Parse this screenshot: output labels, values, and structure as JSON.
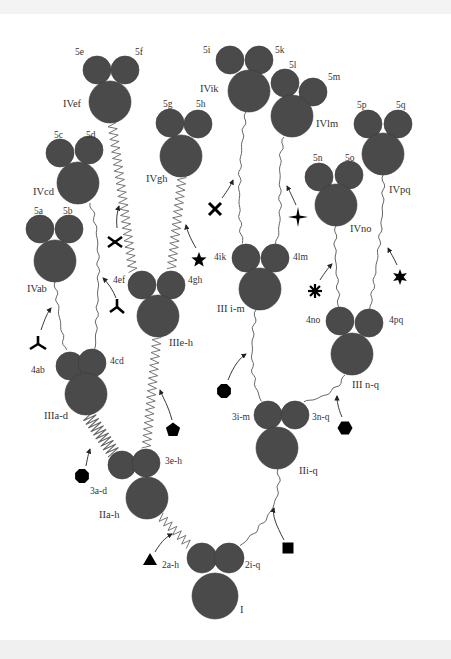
{
  "diagram": {
    "colors": {
      "node_fill": "#4a4a4a",
      "node_edge": "#3a3a3a",
      "line": "#555555",
      "spring": "#666666",
      "marker": "#000000",
      "text": "#333333",
      "background": "#ffffff"
    },
    "nodes": [
      {
        "id": "I",
        "label": "I",
        "cx": 215,
        "cy": 596,
        "r": 23,
        "label_x": 240,
        "label_y": 613,
        "subs": [
          {
            "label": "2a-h",
            "cx": 202,
            "cy": 558,
            "r": 15,
            "lx": 162,
            "ly": 568
          },
          {
            "label": "2i-q",
            "cx": 229,
            "cy": 558,
            "r": 15,
            "lx": 245,
            "ly": 568
          }
        ]
      },
      {
        "id": "IIa-h",
        "label": "IIa-h",
        "cx": 147,
        "cy": 498,
        "r": 21,
        "label_x": 99,
        "label_y": 518,
        "subs": [
          {
            "label": "3a-d",
            "cx": 122,
            "cy": 465,
            "r": 14,
            "lx": 90,
            "ly": 494
          },
          {
            "label": "3e-h",
            "cx": 146,
            "cy": 463,
            "r": 14,
            "lx": 165,
            "ly": 464
          }
        ]
      },
      {
        "id": "IIi-q",
        "label": "IIi-q",
        "cx": 277,
        "cy": 448,
        "r": 21,
        "label_x": 299,
        "label_y": 474,
        "subs": [
          {
            "label": "3i-m",
            "cx": 268,
            "cy": 415,
            "r": 14,
            "lx": 232,
            "ly": 420
          },
          {
            "label": "3n-q",
            "cx": 295,
            "cy": 415,
            "r": 14,
            "lx": 312,
            "ly": 420
          }
        ]
      },
      {
        "id": "IIIa-d",
        "label": "IIIa-d",
        "cx": 86,
        "cy": 394,
        "r": 21,
        "label_x": 44,
        "label_y": 419,
        "subs": [
          {
            "label": "4ab",
            "cx": 70,
            "cy": 366,
            "r": 14,
            "lx": 31,
            "ly": 373
          },
          {
            "label": "4cd",
            "cx": 92,
            "cy": 363,
            "r": 14,
            "lx": 110,
            "ly": 364
          }
        ]
      },
      {
        "id": "IIIe-h",
        "label": "IIIe-h",
        "cx": 158,
        "cy": 316,
        "r": 21,
        "label_x": 169,
        "label_y": 346,
        "subs": [
          {
            "label": "4ef",
            "cx": 142,
            "cy": 285,
            "r": 14,
            "lx": 113,
            "ly": 283
          },
          {
            "label": "4gh",
            "cx": 171,
            "cy": 285,
            "r": 14,
            "lx": 188,
            "ly": 283
          }
        ]
      },
      {
        "id": "IIIi-m",
        "label": "III i-m",
        "cx": 260,
        "cy": 289,
        "r": 21,
        "label_x": 217,
        "label_y": 312,
        "subs": [
          {
            "label": "4ik",
            "cx": 246,
            "cy": 258,
            "r": 14,
            "lx": 214,
            "ly": 260
          },
          {
            "label": "4lm",
            "cx": 275,
            "cy": 258,
            "r": 14,
            "lx": 293,
            "ly": 260
          }
        ]
      },
      {
        "id": "IIIn-q",
        "label": "III n-q",
        "cx": 352,
        "cy": 354,
        "r": 21,
        "label_x": 352,
        "label_y": 388,
        "subs": [
          {
            "label": "4no",
            "cx": 340,
            "cy": 321,
            "r": 14,
            "lx": 306,
            "ly": 323
          },
          {
            "label": "4pq",
            "cx": 369,
            "cy": 323,
            "r": 14,
            "lx": 389,
            "ly": 323
          }
        ]
      },
      {
        "id": "IVab",
        "label": "IVab",
        "cx": 55,
        "cy": 261,
        "r": 21,
        "label_x": 27,
        "label_y": 292,
        "subs": [
          {
            "label": "5a",
            "cx": 40,
            "cy": 229,
            "r": 14,
            "lx": 34,
            "ly": 214
          },
          {
            "label": "5b",
            "cx": 69,
            "cy": 229,
            "r": 14,
            "lx": 63,
            "ly": 214
          }
        ]
      },
      {
        "id": "IVcd",
        "label": "IVcd",
        "cx": 78,
        "cy": 183,
        "r": 21,
        "label_x": 33,
        "label_y": 195,
        "subs": [
          {
            "label": "5c",
            "cx": 60,
            "cy": 153,
            "r": 14,
            "lx": 54,
            "ly": 138
          },
          {
            "label": "5d",
            "cx": 89,
            "cy": 150,
            "r": 14,
            "lx": 86,
            "ly": 138
          }
        ]
      },
      {
        "id": "IVef",
        "label": "IVef",
        "cx": 110,
        "cy": 102,
        "r": 21,
        "label_x": 63,
        "label_y": 107,
        "subs": [
          {
            "label": "5e",
            "cx": 97,
            "cy": 70,
            "r": 14,
            "lx": 75,
            "ly": 55
          },
          {
            "label": "5f",
            "cx": 125,
            "cy": 70,
            "r": 14,
            "lx": 135,
            "ly": 55
          }
        ]
      },
      {
        "id": "IVgh",
        "label": "IVgh",
        "cx": 181,
        "cy": 156,
        "r": 21,
        "label_x": 146,
        "label_y": 182,
        "subs": [
          {
            "label": "5g",
            "cx": 170,
            "cy": 123,
            "r": 14,
            "lx": 163,
            "ly": 107
          },
          {
            "label": "5h",
            "cx": 198,
            "cy": 124,
            "r": 14,
            "lx": 196,
            "ly": 107
          }
        ]
      },
      {
        "id": "IVik",
        "label": "IVik",
        "cx": 249,
        "cy": 91,
        "r": 21,
        "label_x": 200,
        "label_y": 92,
        "subs": [
          {
            "label": "5i",
            "cx": 230,
            "cy": 60,
            "r": 14,
            "lx": 203,
            "ly": 53
          },
          {
            "label": "5k",
            "cx": 259,
            "cy": 60,
            "r": 14,
            "lx": 275,
            "ly": 53
          }
        ]
      },
      {
        "id": "IVlm",
        "label": "IVlm",
        "cx": 292,
        "cy": 116,
        "r": 21,
        "label_x": 316,
        "label_y": 127,
        "subs": [
          {
            "label": "5l",
            "cx": 285,
            "cy": 83,
            "r": 14,
            "lx": 289,
            "ly": 68
          },
          {
            "label": "5m",
            "cx": 313,
            "cy": 92,
            "r": 14,
            "lx": 328,
            "ly": 80
          }
        ]
      },
      {
        "id": "IVno",
        "label": "IVno",
        "cx": 336,
        "cy": 205,
        "r": 21,
        "label_x": 350,
        "label_y": 232,
        "subs": [
          {
            "label": "5n",
            "cx": 319,
            "cy": 177,
            "r": 14,
            "lx": 313,
            "ly": 161
          },
          {
            "label": "5o",
            "cx": 349,
            "cy": 175,
            "r": 14,
            "lx": 345,
            "ly": 161
          }
        ]
      },
      {
        "id": "IVpq",
        "label": "IVpq",
        "cx": 383,
        "cy": 154,
        "r": 21,
        "label_x": 389,
        "label_y": 193,
        "subs": [
          {
            "label": "5p",
            "cx": 368,
            "cy": 124,
            "r": 14,
            "lx": 357,
            "ly": 108
          },
          {
            "label": "5q",
            "cx": 398,
            "cy": 124,
            "r": 14,
            "lx": 396,
            "ly": 108
          }
        ]
      }
    ],
    "links": [
      {
        "from": "IIa-h",
        "to": "2a-h",
        "style": "zigzag",
        "path": "M160,516 L190,546"
      },
      {
        "from": "IIi-q",
        "to": "2i-q",
        "style": "wavy",
        "path": "M278,469 C282,500 270,520 240,546"
      },
      {
        "from": "IIIa-d",
        "to": "3a-d",
        "style": "coil",
        "path": "M88,415 L115,455"
      },
      {
        "from": "IIIe-h",
        "to": "3e-h",
        "style": "zigzag",
        "path": "M157,337 L146,450"
      },
      {
        "from": "IIIi-m",
        "to": "3i-m",
        "style": "wavy",
        "path": "M256,310 C250,350 250,380 262,402"
      },
      {
        "from": "IIIn-q",
        "to": "3n-q",
        "style": "wavy",
        "path": "M345,375 C335,395 315,400 302,402"
      },
      {
        "from": "IVab",
        "to": "4ab",
        "style": "wavy",
        "path": "M55,282 C58,310 62,335 66,353"
      },
      {
        "from": "IVcd",
        "to": "4cd",
        "style": "wavy",
        "path": "M90,203 C100,230 100,270 95,350"
      },
      {
        "from": "IVef",
        "to": "4ef",
        "style": "zigzag",
        "path": "M112,123 L133,272"
      },
      {
        "from": "IVgh",
        "to": "4gh",
        "style": "zigzag",
        "path": "M182,177 L171,272"
      },
      {
        "from": "IVik",
        "to": "4ik",
        "style": "wavy",
        "path": "M246,112 C240,150 236,210 243,245"
      },
      {
        "from": "IVlm",
        "to": "4lm",
        "style": "wavy",
        "path": "M284,137 C275,170 285,210 276,245"
      },
      {
        "from": "IVno",
        "to": "4no",
        "style": "wavy",
        "path": "M336,226 C333,260 340,290 338,308"
      },
      {
        "from": "IVpq",
        "to": "4pq",
        "style": "wavy",
        "path": "M383,175 C385,220 375,270 370,310"
      }
    ],
    "markers": [
      {
        "shape": "triangle",
        "name": "triangle-marker",
        "x": 150,
        "y": 560,
        "arrow": "M155,552 C162,540 168,536 172,534"
      },
      {
        "shape": "square",
        "name": "square-marker",
        "x": 288,
        "y": 548,
        "arrow": "M284,540 C276,525 272,515 274,508"
      },
      {
        "shape": "octagon",
        "name": "octagon-marker",
        "x": 82,
        "y": 476,
        "arrow": "M86,466 C88,455 89,452 90,449"
      },
      {
        "shape": "pentagon",
        "name": "pentagon-marker",
        "x": 173,
        "y": 430,
        "arrow": "M172,420 C168,405 163,398 160,390"
      },
      {
        "shape": "octagon",
        "name": "octagon-marker",
        "x": 224,
        "y": 391,
        "arrow": "M228,380 C234,365 240,358 246,354"
      },
      {
        "shape": "hexagon",
        "name": "hexagon-marker",
        "x": 345,
        "y": 428,
        "arrow": "M342,417 C338,408 337,401 337,396"
      },
      {
        "shape": "trident-y",
        "name": "y-shape-marker",
        "x": 38,
        "y": 344,
        "arrow": "M41,330 C45,318 48,312 51,308"
      },
      {
        "shape": "trident-inv",
        "name": "inverted-y-marker",
        "x": 117,
        "y": 307,
        "arrow": "M116,298 C113,290 108,283 103,278"
      },
      {
        "shape": "cross",
        "name": "cross-marker",
        "x": 115,
        "y": 242,
        "arrow": "M117,228 C116,220 117,212 119,206"
      },
      {
        "shape": "star5",
        "name": "star-marker",
        "x": 199,
        "y": 260,
        "arrow": "M196,248 C190,238 187,230 186,225"
      },
      {
        "shape": "x-mark",
        "name": "x-marker",
        "x": 215,
        "y": 209,
        "arrow": "M222,198 C228,190 231,185 233,180"
      },
      {
        "shape": "star4",
        "name": "four-point-star-marker",
        "x": 298,
        "y": 217,
        "arrow": "M296,205 C292,196 289,190 287,186"
      },
      {
        "shape": "asterisk",
        "name": "asterisk-marker",
        "x": 315,
        "y": 291,
        "arrow": "M320,280 C325,272 329,267 332,264"
      },
      {
        "shape": "star6",
        "name": "six-point-star-marker",
        "x": 400,
        "y": 277,
        "arrow": "M397,265 C394,258 390,252 388,248"
      }
    ]
  }
}
